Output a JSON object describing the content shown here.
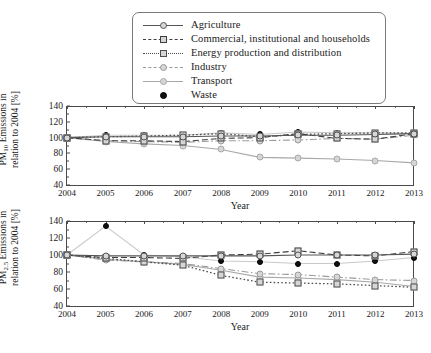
{
  "legend": {
    "items": [
      {
        "label": "Agriculture",
        "key": "agriculture",
        "color": "#555555",
        "marker": "circle",
        "dash": "solid"
      },
      {
        "label": "Commercial, institutional and households",
        "key": "commercial",
        "color": "#3f3f3f",
        "marker": "square",
        "dash": "dashed"
      },
      {
        "label": "Energy production and distribution",
        "key": "energy",
        "color": "#4d4d4d",
        "marker": "square",
        "dash": "dotted"
      },
      {
        "label": "Industry",
        "key": "industry",
        "color": "#9a9a9a",
        "marker": "circle",
        "dash": "dashdot"
      },
      {
        "label": "Transport",
        "key": "transport",
        "color": "#a8a8a8",
        "marker": "circle",
        "dash": "solid"
      },
      {
        "label": "Waste",
        "key": "waste",
        "color": "#111111",
        "marker": "dot",
        "dash": "none"
      }
    ]
  },
  "chart_data": [
    {
      "id": "pm10",
      "type": "line",
      "title": "",
      "xlabel": "Year",
      "ylabel": "PM10 Emissions in relation to 2004 [%]",
      "ylabel_line1": "PM10 Emissions in",
      "ylabel_line2": "relation to 2004 [%]",
      "ylabel_sub": "10",
      "x": [
        2004,
        2005,
        2006,
        2007,
        2008,
        2009,
        2010,
        2011,
        2012,
        2013
      ],
      "xlim": [
        2004,
        2013
      ],
      "ylim": [
        40,
        140
      ],
      "yticks": [
        40,
        60,
        80,
        100,
        120,
        140
      ],
      "xticks": [
        2004,
        2005,
        2006,
        2007,
        2008,
        2009,
        2010,
        2011,
        2012,
        2013
      ],
      "grid": false,
      "legend_position": "top",
      "series": [
        {
          "name": "Agriculture",
          "values": [
            100,
            101,
            101,
            101,
            102,
            102,
            103,
            103,
            104,
            105
          ]
        },
        {
          "name": "Commercial, institutional and households",
          "values": [
            100,
            96,
            96,
            95,
            99,
            100,
            105,
            99,
            98,
            105
          ]
        },
        {
          "name": "Energy production and distribution",
          "values": [
            100,
            101,
            102,
            103,
            105,
            101,
            104,
            105,
            106,
            106
          ]
        },
        {
          "name": "Industry",
          "values": [
            100,
            96,
            95,
            94,
            96,
            96,
            97,
            99,
            98,
            103
          ]
        },
        {
          "name": "Transport",
          "values": [
            100,
            95,
            92,
            90,
            85,
            75,
            74,
            73,
            71,
            68
          ]
        },
        {
          "name": "Waste",
          "values": [
            100,
            103,
            103,
            103,
            106,
            104,
            107,
            106,
            106,
            105
          ]
        }
      ]
    },
    {
      "id": "pm25",
      "type": "line",
      "title": "",
      "xlabel": "Year",
      "ylabel": "PM2.5 Emissions in relation to 2004 [%]",
      "ylabel_line1": "PM2.5 Emissions in",
      "ylabel_line2": "relation to 2004 [%]",
      "ylabel_sub": "2.5",
      "x": [
        2004,
        2005,
        2006,
        2007,
        2008,
        2009,
        2010,
        2011,
        2012,
        2013
      ],
      "xlim": [
        2004,
        2013
      ],
      "ylim": [
        40,
        140
      ],
      "yticks": [
        40,
        60,
        80,
        100,
        120,
        140
      ],
      "xticks": [
        2004,
        2005,
        2006,
        2007,
        2008,
        2009,
        2010,
        2011,
        2012,
        2013
      ],
      "grid": false,
      "legend_position": "shared-top",
      "series": [
        {
          "name": "Agriculture",
          "values": [
            100,
            99,
            99,
            99,
            99,
            99,
            100,
            100,
            100,
            101
          ]
        },
        {
          "name": "Commercial, institutional and households",
          "values": [
            100,
            97,
            97,
            96,
            100,
            101,
            105,
            100,
            99,
            104
          ]
        },
        {
          "name": "Energy production and distribution",
          "values": [
            100,
            96,
            92,
            88,
            76,
            68,
            67,
            66,
            64,
            62
          ]
        },
        {
          "name": "Industry",
          "values": [
            100,
            94,
            92,
            90,
            84,
            78,
            77,
            74,
            71,
            70
          ]
        },
        {
          "name": "Transport",
          "values": [
            100,
            95,
            92,
            89,
            82,
            74,
            73,
            71,
            68,
            63
          ]
        },
        {
          "name": "Waste",
          "values": [
            100,
            134,
            100,
            98,
            93,
            92,
            90,
            90,
            93,
            97
          ]
        }
      ]
    }
  ]
}
